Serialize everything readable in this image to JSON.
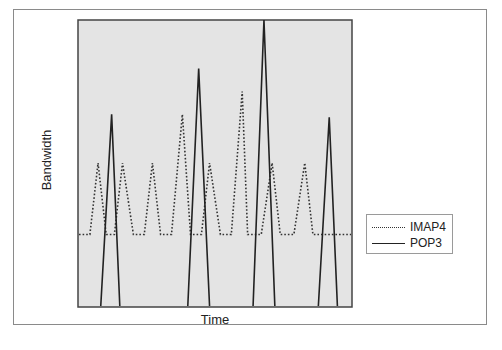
{
  "chart_data": {
    "type": "line",
    "title": "",
    "xlabel": "Time",
    "ylabel": "Bandwidth",
    "x_ticks": [],
    "y_ticks": [],
    "grid": false,
    "legend_position": "right",
    "plot_background": "#e4e4e4",
    "x_range": [
      0,
      100
    ],
    "y_range": [
      0,
      100
    ],
    "series": [
      {
        "name": "IMAP4",
        "style": "dotted",
        "color": "#333333",
        "points": [
          [
            0,
            25
          ],
          [
            4,
            25
          ],
          [
            7,
            50
          ],
          [
            10,
            25
          ],
          [
            13,
            25
          ],
          [
            16,
            50
          ],
          [
            20,
            25
          ],
          [
            24,
            25
          ],
          [
            27,
            50
          ],
          [
            30,
            25
          ],
          [
            34,
            25
          ],
          [
            38,
            67
          ],
          [
            41,
            25
          ],
          [
            45,
            25
          ],
          [
            48,
            50
          ],
          [
            52,
            25
          ],
          [
            56,
            25
          ],
          [
            60,
            75
          ],
          [
            62,
            25
          ],
          [
            67,
            25
          ],
          [
            71,
            50
          ],
          [
            74,
            25
          ],
          [
            79,
            25
          ],
          [
            83,
            50
          ],
          [
            86,
            25
          ],
          [
            100,
            25
          ]
        ]
      },
      {
        "name": "POP3",
        "style": "solid",
        "color": "#222222",
        "points": [
          [
            8,
            0
          ],
          [
            12,
            67
          ],
          [
            15,
            0
          ],
          [
            40,
            0
          ],
          [
            44,
            83
          ],
          [
            48,
            0
          ],
          [
            64,
            0
          ],
          [
            68,
            100
          ],
          [
            72,
            0
          ],
          [
            88,
            0
          ],
          [
            92,
            66
          ],
          [
            95,
            0
          ]
        ]
      }
    ]
  },
  "axes": {
    "xlabel": "Time",
    "ylabel": "Bandwidth"
  },
  "legend": {
    "items": [
      {
        "label": "IMAP4",
        "style": "dotted"
      },
      {
        "label": "POP3",
        "style": "solid"
      }
    ]
  }
}
